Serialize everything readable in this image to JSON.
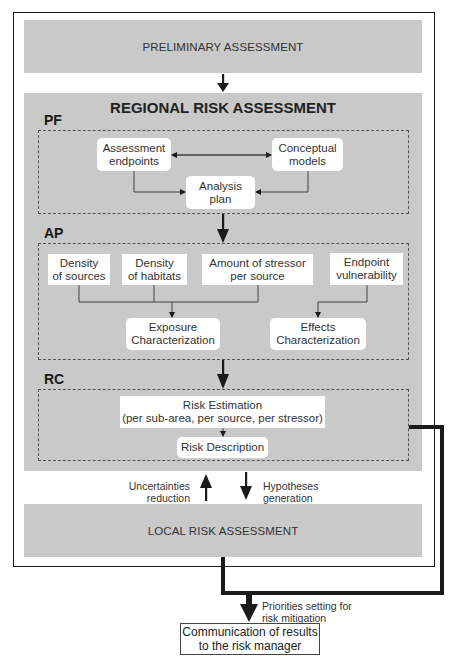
{
  "preliminary": {
    "label": "PRELIMINARY ASSESSMENT"
  },
  "regional": {
    "title": "REGIONAL RISK ASSESSMENT",
    "pf": {
      "label": "PF",
      "nodes": {
        "assessment_endpoints": "Assessment\nendpoints",
        "conceptual_models": "Conceptual\nmodels",
        "analysis_plan": "Analysis\nplan"
      }
    },
    "ap": {
      "label": "AP",
      "nodes": {
        "density_sources": "Density\nof sources",
        "density_habitats": "Density\nof habitats",
        "amount_stressor": "Amount of stressor\nper source",
        "endpoint_vulnerability": "Endpoint\nvulnerability",
        "exposure": "Exposure\nCharacterization",
        "effects": "Effects\nCharacterization"
      }
    },
    "rc": {
      "label": "RC",
      "nodes": {
        "risk_estimation": "Risk Estimation\n(per sub-area, per source, per stressor)",
        "risk_description": "Risk Description"
      }
    }
  },
  "feedback": {
    "up_label": "Uncertainties\nreduction",
    "down_label": "Hypotheses\ngeneration"
  },
  "local": {
    "label": "LOCAL RISK ASSESSMENT"
  },
  "output": {
    "arrow_label": "Priorities setting for\nrisk mitigation",
    "communication": "Communication of results\nto the risk manager"
  },
  "colors": {
    "band_grey": "#c9c9c9",
    "line": "#1a1a1a",
    "box_fill": "#ffffff"
  }
}
